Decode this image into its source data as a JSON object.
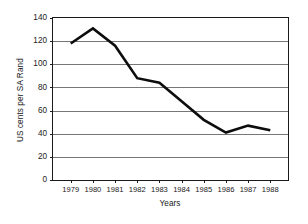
{
  "chart_data": {
    "type": "line",
    "title": "",
    "xlabel": "Years",
    "ylabel": "US cents per SA Rand",
    "categories": [
      "1979",
      "1980",
      "1981",
      "1982",
      "1983",
      "1984",
      "1985",
      "1986",
      "1987",
      "1988"
    ],
    "x": [
      1979,
      1980,
      1981,
      1982,
      1983,
      1984,
      1985,
      1986,
      1987,
      1988
    ],
    "values": [
      118,
      131,
      116,
      88,
      84,
      68,
      52,
      41,
      47,
      43
    ],
    "series": [
      {
        "name": "US cents per SA Rand",
        "values": [
          118,
          131,
          116,
          88,
          84,
          68,
          52,
          41,
          47,
          43
        ]
      }
    ],
    "ylim": [
      0,
      140
    ],
    "yticks": [
      0,
      20,
      40,
      60,
      80,
      100,
      120,
      140
    ],
    "ytick_labels": [
      "0",
      "20",
      "40",
      "60",
      "80",
      "100",
      "120",
      "140"
    ],
    "xlim": [
      1978.5,
      1988.5
    ],
    "grid": "horizontal",
    "legend": "none",
    "line_color": "#0d0d0d",
    "grid_color": "#555555",
    "frame_color": "#1a1a1a",
    "background": "#ffffff"
  }
}
